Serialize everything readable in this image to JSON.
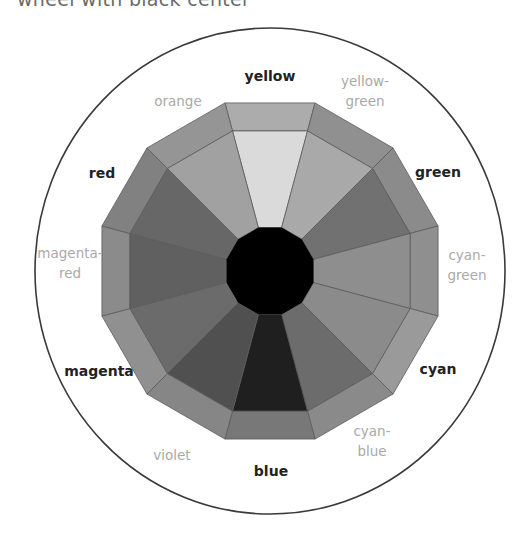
{
  "title": "wheel with black center",
  "wheel": {
    "center": [
      270,
      271
    ],
    "outer_ellipse": {
      "rx": 235,
      "ry": 243,
      "stroke": "#3a3a3a"
    },
    "outer_radius": 174,
    "ring_radius": 145,
    "core_radius": 45,
    "core_color": "#000000",
    "segment_stroke": "#5a5a5a",
    "segments": [
      {
        "name": "yellow",
        "primary": true,
        "inner": "#dadada",
        "outer": "#acacac",
        "label_lines": [
          "yellow"
        ],
        "label_pos": [
          270,
          76
        ]
      },
      {
        "name": "yellow-green",
        "primary": false,
        "inner": "#a9a9a9",
        "outer": "#909090",
        "label_lines": [
          "yellow-",
          "green"
        ],
        "label_pos": [
          365,
          91
        ]
      },
      {
        "name": "green",
        "primary": true,
        "inner": "#717171",
        "outer": "#8b8b8b",
        "label_lines": [
          "green"
        ],
        "label_pos": [
          438,
          172
        ]
      },
      {
        "name": "cyan-green",
        "primary": false,
        "inner": "#8e8e8e",
        "outer": "#8f8f8f",
        "label_lines": [
          "cyan-",
          "green"
        ],
        "label_pos": [
          467,
          265
        ]
      },
      {
        "name": "cyan",
        "primary": true,
        "inner": "#8b8b8b",
        "outer": "#9a9a9a",
        "label_lines": [
          "cyan"
        ],
        "label_pos": [
          438,
          369
        ]
      },
      {
        "name": "cyan-blue",
        "primary": false,
        "inner": "#6c6c6c",
        "outer": "#8a8a8a",
        "label_lines": [
          "cyan-",
          "blue"
        ],
        "label_pos": [
          372,
          441
        ]
      },
      {
        "name": "blue",
        "primary": true,
        "inner": "#1f1f1f",
        "outer": "#787878",
        "label_lines": [
          "blue"
        ],
        "label_pos": [
          271,
          471
        ]
      },
      {
        "name": "violet",
        "primary": false,
        "inner": "#505050",
        "outer": "#868686",
        "label_lines": [
          "violet"
        ],
        "label_pos": [
          172,
          455
        ]
      },
      {
        "name": "magenta",
        "primary": true,
        "inner": "#6b6b6b",
        "outer": "#909090",
        "label_lines": [
          "magenta"
        ],
        "label_pos": [
          99,
          371
        ]
      },
      {
        "name": "magenta-red",
        "primary": false,
        "inner": "#606060",
        "outer": "#8b8b8b",
        "label_lines": [
          "magenta-",
          "red"
        ],
        "label_pos": [
          70,
          263
        ]
      },
      {
        "name": "red",
        "primary": true,
        "inner": "#676767",
        "outer": "#818181",
        "label_lines": [
          "red"
        ],
        "label_pos": [
          102,
          173
        ]
      },
      {
        "name": "orange",
        "primary": false,
        "inner": "#a1a1a1",
        "outer": "#959595",
        "label_lines": [
          "orange"
        ],
        "label_pos": [
          178,
          101
        ]
      }
    ]
  }
}
